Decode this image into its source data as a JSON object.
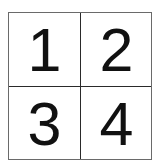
{
  "grid": {
    "rows": 2,
    "cols": 2,
    "cells": [
      {
        "label": "1"
      },
      {
        "label": "2"
      },
      {
        "label": "3"
      },
      {
        "label": "4"
      }
    ],
    "colors": {
      "border": "#6a6a6a",
      "divider": "#2a2a2a",
      "text": "#111111",
      "background": "#ffffff"
    }
  }
}
